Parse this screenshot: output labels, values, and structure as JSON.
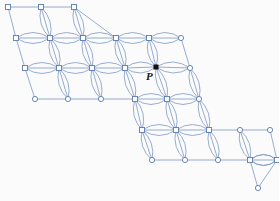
{
  "figure": {
    "kind": "graph-lattice-diagram",
    "background_color": "#fbfbfc",
    "edge_color": "#7d98c4",
    "node_stroke_color": "#5a7bb0",
    "node_fill_color": "#ffffff",
    "marked_point_color": "#14100e",
    "width": 279,
    "height": 201
  },
  "labels": [
    {
      "name": "point-p-label",
      "text": "P",
      "x": 146,
      "y": 71
    }
  ],
  "marked_points": [
    {
      "name": "point-p",
      "x": 156,
      "y": 67,
      "size": 5,
      "style": "filled-square"
    }
  ],
  "geometry": {
    "col_step": 33.3,
    "row_step": 30.5,
    "row_shear": 9.4,
    "node_square_size": 5,
    "node_circle_radius": 2.6,
    "lens_height": 11
  },
  "rows": [
    {
      "index": 0,
      "y": 7,
      "x_start": 8,
      "count": 3,
      "node_style": "square",
      "first_style": "square"
    },
    {
      "index": 1,
      "y": 38,
      "x_start": 16,
      "count": 6,
      "node_style": "square",
      "last_style": "circle"
    },
    {
      "index": 2,
      "y": 68,
      "x_start": 25,
      "count": 6,
      "node_style": "square",
      "last_style": "circle"
    },
    {
      "index": 3,
      "y": 99,
      "x_start": 35,
      "count": 5,
      "node_style": "circle",
      "squares_from": 3
    },
    {
      "index": 4,
      "y": 130,
      "x_start": 142,
      "count": 5,
      "node_style": "square",
      "squares_to": 2
    },
    {
      "index": 5,
      "y": 160,
      "x_start": 152,
      "count": 5,
      "node_style": "circle",
      "squares_from": 3
    },
    {
      "index": 6,
      "y": 188,
      "x_start": 258,
      "count": 1,
      "node_style": "circle"
    }
  ],
  "chart_data": {
    "type": "scatter",
    "title": "",
    "xlabel": "",
    "ylabel": "",
    "nodes": [
      {
        "id": "r0c0",
        "x": 8,
        "y": 7,
        "shape": "square"
      },
      {
        "id": "r0c1",
        "x": 41,
        "y": 7,
        "shape": "square"
      },
      {
        "id": "r0c2",
        "x": 74,
        "y": 7,
        "shape": "square"
      },
      {
        "id": "r1c0",
        "x": 16,
        "y": 38,
        "shape": "square"
      },
      {
        "id": "r1c1",
        "x": 50,
        "y": 38,
        "shape": "square"
      },
      {
        "id": "r1c2",
        "x": 83,
        "y": 38,
        "shape": "square"
      },
      {
        "id": "r1c3",
        "x": 116,
        "y": 38,
        "shape": "square"
      },
      {
        "id": "r1c4",
        "x": 149,
        "y": 38,
        "shape": "square"
      },
      {
        "id": "r1c5",
        "x": 181,
        "y": 38,
        "shape": "circle"
      },
      {
        "id": "r2c0",
        "x": 25,
        "y": 68,
        "shape": "square"
      },
      {
        "id": "r2c1",
        "x": 59,
        "y": 68,
        "shape": "square"
      },
      {
        "id": "r2c2",
        "x": 92,
        "y": 68,
        "shape": "square"
      },
      {
        "id": "r2c3",
        "x": 125,
        "y": 68,
        "shape": "square"
      },
      {
        "id": "r2c4",
        "x": 156,
        "y": 67,
        "shape": "filled-square"
      },
      {
        "id": "r2c5",
        "x": 190,
        "y": 68,
        "shape": "circle"
      },
      {
        "id": "r3c0",
        "x": 35,
        "y": 99,
        "shape": "circle"
      },
      {
        "id": "r3c1",
        "x": 68,
        "y": 99,
        "shape": "circle"
      },
      {
        "id": "r3c2",
        "x": 101,
        "y": 99,
        "shape": "circle"
      },
      {
        "id": "r3c3",
        "x": 135,
        "y": 99,
        "shape": "square"
      },
      {
        "id": "r3c4",
        "x": 167,
        "y": 99,
        "shape": "square"
      },
      {
        "id": "r3c5",
        "x": 199,
        "y": 99,
        "shape": "circle"
      },
      {
        "id": "r4c0",
        "x": 142,
        "y": 130,
        "shape": "square"
      },
      {
        "id": "r4c1",
        "x": 176,
        "y": 130,
        "shape": "square"
      },
      {
        "id": "r4c2",
        "x": 209,
        "y": 130,
        "shape": "square"
      },
      {
        "id": "r4c3",
        "x": 240,
        "y": 130,
        "shape": "circle"
      },
      {
        "id": "r4c4",
        "x": 270,
        "y": 130,
        "shape": "circle"
      },
      {
        "id": "r5c0",
        "x": 152,
        "y": 160,
        "shape": "circle"
      },
      {
        "id": "r5c1",
        "x": 185,
        "y": 160,
        "shape": "circle"
      },
      {
        "id": "r5c2",
        "x": 218,
        "y": 160,
        "shape": "circle"
      },
      {
        "id": "r5c3",
        "x": 250,
        "y": 160,
        "shape": "square"
      },
      {
        "id": "r5c4",
        "x": 277,
        "y": 160,
        "shape": "square"
      },
      {
        "id": "r6c0",
        "x": 258,
        "y": 188,
        "shape": "circle"
      }
    ],
    "annotations": [
      {
        "text": "P",
        "x": 146,
        "y": 71,
        "target": "r2c4"
      }
    ]
  }
}
